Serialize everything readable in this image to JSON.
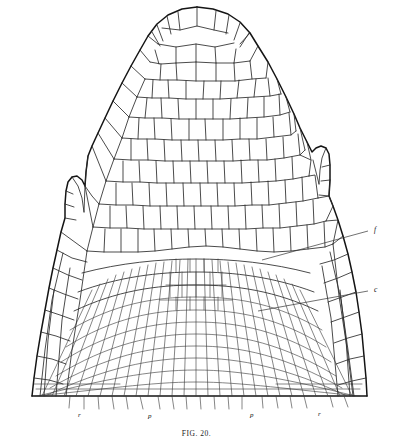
{
  "figure": {
    "caption": "FIG. 20.",
    "kind": "botanical-line-drawing",
    "background_color": "#ffffff",
    "ink_color": "#2b2b2b",
    "outline_color": "#141414"
  },
  "labels": {
    "right": [
      {
        "id": "label-f",
        "text": "f",
        "x": 374,
        "y": 232,
        "leader_from_x": 262,
        "leader_from_y": 260
      },
      {
        "id": "label-c",
        "text": "c",
        "x": 374,
        "y": 292,
        "leader_from_x": 258,
        "leader_from_y": 311
      }
    ],
    "bottom": [
      {
        "id": "label-r-left",
        "text": "r",
        "x": 78,
        "y": 417
      },
      {
        "id": "label-p-left",
        "text": "p",
        "x": 148,
        "y": 418
      },
      {
        "id": "label-p-right",
        "text": "p",
        "x": 250,
        "y": 417
      },
      {
        "id": "label-r-right",
        "text": "r",
        "x": 318,
        "y": 416
      }
    ]
  },
  "regions": {
    "apex": "apical dome with large polygonal initial cells",
    "primordium_left": "leaf primordium bump, left flank",
    "primordium_right": "leaf primordium bump, right flank",
    "procambium": "dense fan of radiating narrow cell files in lower centre",
    "cortex": "broad polygonal cells flanking the axis"
  }
}
